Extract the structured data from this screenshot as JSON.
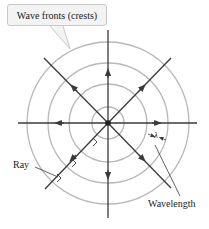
{
  "diagram": {
    "labels": {
      "wave_fronts": "Wave fronts (crests)",
      "ray": "Ray",
      "wavelength": "Wavelength",
      "lambda": "λ"
    },
    "center": {
      "x": 108,
      "y": 123
    },
    "wave_front_radii": [
      16,
      39,
      60,
      81
    ],
    "ray_directions": [
      "up",
      "down",
      "left",
      "right",
      "up-left",
      "up-right",
      "down-left",
      "down-right"
    ],
    "colors": {
      "wave_front": "#b8b8b8",
      "ray": "#3a3a3a",
      "callout_fill": "#f3f3f3",
      "callout_border": "#c8c8c8",
      "text": "#222222"
    }
  }
}
